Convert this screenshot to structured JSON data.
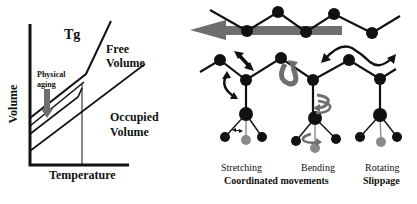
{
  "left_panel": {
    "tg_label": "Tg",
    "free_volume_line1": "Free",
    "free_volume_line2": "Volume",
    "physical_aging_line1": "Physical",
    "physical_aging_line2": "aging",
    "occupied_volume_line1": "Occupied",
    "occupied_volume_line2": "Volume",
    "y_axis_label": "Volume",
    "x_axis_label": "Temperature"
  },
  "right_panel": {
    "labels": {
      "stretching": "Stretching",
      "bending": "Bending",
      "rotating": "Rotating",
      "coordinated": "Coordinated movements",
      "slippage": "Slippage"
    }
  },
  "colors": {
    "line": "#111111",
    "arrow_grey": "#6e6e6e",
    "atom_grey": "#8a8a8a"
  }
}
